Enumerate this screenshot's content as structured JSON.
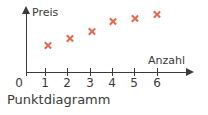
{
  "caption": "Punktdiagramm",
  "colors": {
    "marker": "#e4694f",
    "axis": "#3b3b3b",
    "text": "#3a3a3a",
    "background": "#ffffff"
  },
  "chart_data": {
    "type": "scatter",
    "title": "Punktdiagramm",
    "xlabel": "Anzahl",
    "ylabel": "Preis",
    "grid": false,
    "legend": false,
    "origin_label": "0",
    "xticklabels": [
      "0",
      "1",
      "2",
      "3",
      "4",
      "5",
      "6"
    ],
    "xticks": [
      0,
      1,
      2,
      3,
      4,
      5,
      6
    ],
    "yticklabels": [],
    "xlim": [
      0,
      6.8
    ],
    "ylim": [
      0,
      6.6
    ],
    "x": [
      1,
      2,
      3,
      4,
      5,
      6
    ],
    "y": [
      2.6,
      3.3,
      4.0,
      5.1,
      5.4,
      5.8
    ],
    "marker": "x",
    "marker_color": "#e4694f",
    "points": [
      {
        "x": "1",
        "y": "2.6"
      },
      {
        "x": "2",
        "y": "3.3"
      },
      {
        "x": "3",
        "y": "4.0"
      },
      {
        "x": "4",
        "y": "5.1"
      },
      {
        "x": "5",
        "y": "5.4"
      },
      {
        "x": "6",
        "y": "5.8"
      }
    ]
  }
}
